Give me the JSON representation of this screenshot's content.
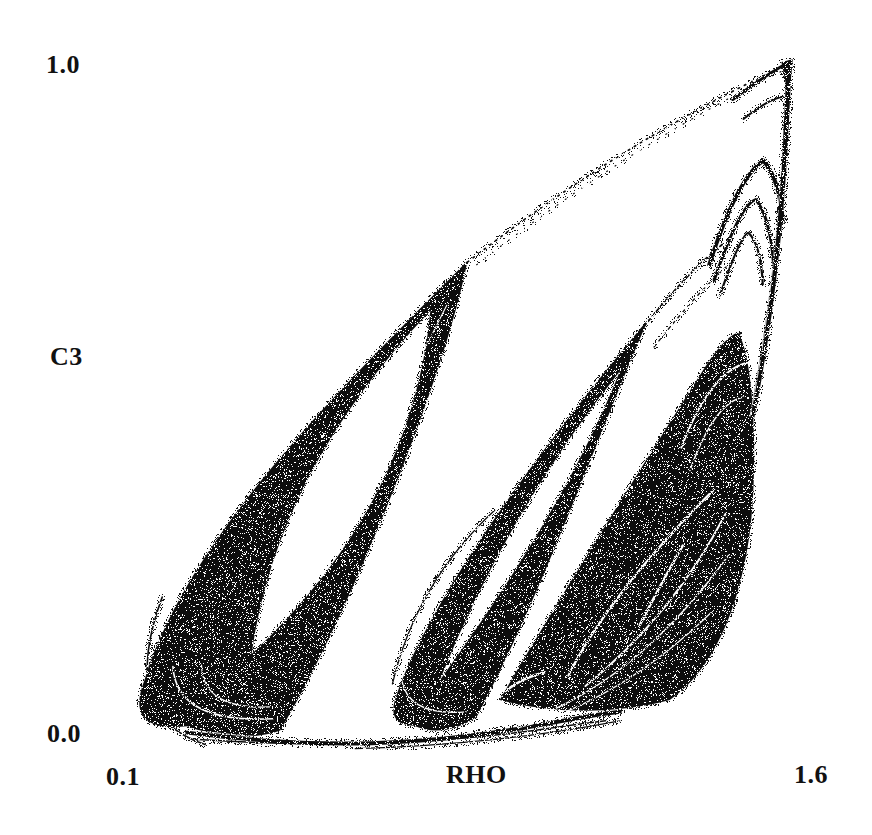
{
  "figure": {
    "background": "#ffffff",
    "ink": "#0d0d0d",
    "y_axis": {
      "label": "C3",
      "tick_top": "1.0",
      "tick_bottom": "0.0"
    },
    "x_axis": {
      "label": "RHO",
      "tick_left": "0.1",
      "tick_right": "1.6"
    }
  },
  "chart_data": {
    "type": "scatter",
    "title": "",
    "xlabel": "RHO",
    "ylabel": "C3",
    "xlim": [
      0.1,
      1.6
    ],
    "ylim": [
      0.0,
      1.0
    ],
    "xticks": [
      "0.1",
      "1.6"
    ],
    "yticks": [
      "0.0",
      "1.0"
    ],
    "grid": false,
    "legend": null,
    "key_points_data_units": {
      "cusp": [
        1.53,
        0.99
      ],
      "left_lobe_tip": [
        0.86,
        0.7
      ],
      "left_lobe_turn": [
        0.25,
        0.05
      ],
      "middle_lobe_tip": [
        1.24,
        0.62
      ],
      "middle_lobe_turn": [
        0.73,
        0.07
      ],
      "right_spiral_core": [
        1.27,
        0.23
      ],
      "bottom_tail_c3": 0.03
    },
    "geometry": {
      "dark_fills": [
        {
          "name": "left-lobe",
          "path": [
            [
              "M",
              0.507,
              0.296
            ],
            [
              "C",
              0.36,
              0.45,
              0.12,
              0.68,
              0.055,
              0.9
            ],
            [
              "C",
              0.035,
              0.952,
              0.058,
              0.972,
              0.115,
              0.966
            ],
            [
              "C",
              0.16,
              0.984,
              0.21,
              0.985,
              0.245,
              0.972
            ],
            [
              "C",
              0.33,
              0.83,
              0.475,
              0.47,
              0.507,
              0.296
            ],
            [
              "Z"
            ]
          ]
        },
        {
          "name": "middle-lobe",
          "path": [
            [
              "M",
              0.76,
              0.38
            ],
            [
              "C",
              0.63,
              0.54,
              0.465,
              0.76,
              0.408,
              0.92
            ],
            [
              "C",
              0.396,
              0.952,
              0.408,
              0.964,
              0.432,
              0.965
            ],
            [
              "C",
              0.46,
              0.978,
              0.492,
              0.972,
              0.52,
              0.952
            ],
            [
              "C",
              0.61,
              0.78,
              0.69,
              0.545,
              0.76,
              0.38
            ],
            [
              "Z"
            ]
          ]
        },
        {
          "name": "right-mass",
          "path": [
            [
              "M",
              0.552,
              0.928
            ],
            [
              "C",
              0.63,
              0.79,
              0.77,
              0.56,
              0.845,
              0.44
            ],
            [
              "C",
              0.862,
              0.415,
              0.878,
              0.4,
              0.885,
              0.4
            ],
            [
              "C",
              0.908,
              0.43,
              0.915,
              0.6,
              0.9,
              0.7
            ],
            [
              "C",
              0.885,
              0.8,
              0.85,
              0.885,
              0.79,
              0.928
            ],
            [
              "C",
              0.7,
              0.952,
              0.615,
              0.945,
              0.552,
              0.928
            ],
            [
              "Z"
            ]
          ]
        },
        {
          "name": "cusp-tip",
          "path": [
            [
              "M",
              0.946,
              0.01
            ],
            [
              "L",
              0.962,
              0.006
            ],
            [
              "L",
              0.956,
              0.06
            ],
            [
              "Z"
            ]
          ]
        }
      ],
      "white_fills": [
        {
          "name": "left-lobe-hole",
          "path": [
            [
              "M",
              0.455,
              0.368
            ],
            [
              "Q",
              0.24,
              0.6,
              0.205,
              0.862
            ],
            [
              "Q",
              0.43,
              0.645,
              0.455,
              0.368
            ],
            [
              "Z"
            ]
          ]
        },
        {
          "name": "middle-lobe-hole",
          "path": [
            [
              "M",
              0.72,
              0.455
            ],
            [
              "Q",
              0.562,
              0.658,
              0.468,
              0.9
            ],
            [
              "Q",
              0.646,
              0.648,
              0.72,
              0.455
            ],
            [
              "Z"
            ]
          ]
        }
      ],
      "dark_strokes": [
        {
          "name": "bottom-tail",
          "w": 4,
          "path": [
            [
              "M",
              0.115,
              0.975
            ],
            [
              "C",
              0.3,
              1.0,
              0.45,
              0.995,
              0.62,
              0.962
            ],
            [
              "Q",
              0.68,
              0.95,
              0.72,
              0.945
            ]
          ]
        },
        {
          "name": "bottom-tail-2",
          "w": 1.6,
          "path": [
            [
              "M",
              0.13,
              0.985
            ],
            [
              "Q",
              0.38,
              1.002,
              0.6,
              0.972
            ],
            [
              "Q",
              0.66,
              0.963,
              0.7,
              0.958
            ]
          ]
        },
        {
          "name": "bottom-tail-3",
          "w": 1.2,
          "path": [
            [
              "M",
              0.35,
              0.998
            ],
            [
              "Q",
              0.55,
              0.992,
              0.72,
              0.958
            ]
          ]
        },
        {
          "name": "left-lobe-echo",
          "w": 1.6,
          "path": [
            [
              "M",
              0.08,
              0.78
            ],
            [
              "Q",
              0.018,
              0.952,
              0.14,
              0.992
            ]
          ]
        },
        {
          "name": "middle-lobe-echo",
          "w": 1.3,
          "path": [
            [
              "M",
              0.402,
              0.905
            ],
            [
              "Q",
              0.435,
              0.76,
              0.545,
              0.655
            ]
          ]
        },
        {
          "name": "right-spine",
          "w": 5,
          "path": [
            [
              "M",
              0.905,
              0.52
            ],
            [
              "C",
              0.928,
              0.4,
              0.945,
              0.26,
              0.952,
              0.118
            ],
            [
              "Q",
              0.955,
              0.05,
              0.957,
              0.012
            ]
          ]
        },
        {
          "name": "fold-1a",
          "w": 4,
          "path": [
            [
              "M",
              0.845,
              0.302
            ],
            [
              "Q",
              0.885,
              0.175,
              0.921,
              0.152
            ],
            [
              "Q",
              0.944,
              0.18,
              0.948,
              0.24
            ]
          ]
        },
        {
          "name": "fold-1b",
          "w": 3,
          "path": [
            [
              "M",
              0.852,
              0.324
            ],
            [
              "Q",
              0.888,
              0.215,
              0.91,
              0.208
            ],
            [
              "Q",
              0.93,
              0.232,
              0.935,
              0.3
            ]
          ]
        },
        {
          "name": "fold-1c",
          "w": 2.2,
          "path": [
            [
              "M",
              0.86,
              0.346
            ],
            [
              "Q",
              0.89,
              0.256,
              0.9,
              0.256
            ],
            [
              "Q",
              0.917,
              0.272,
              0.92,
              0.33
            ]
          ]
        },
        {
          "name": "cusp-hook-a",
          "w": 3,
          "path": [
            [
              "M",
              0.878,
              0.064
            ],
            [
              "Q",
              0.925,
              0.028,
              0.957,
              0.01
            ]
          ]
        },
        {
          "name": "cusp-hook-b",
          "w": 2,
          "path": [
            [
              "M",
              0.893,
              0.092
            ],
            [
              "Q",
              0.93,
              0.062,
              0.948,
              0.06
            ]
          ]
        },
        {
          "name": "fold-2a",
          "w": 2.5,
          "path": [
            [
              "M",
              0.806,
              0.54
            ],
            [
              "Q",
              0.846,
              0.435,
              0.887,
              0.402
            ]
          ]
        }
      ],
      "white_strokes": [
        {
          "name": "left-u-sliver-1",
          "w": 1.6,
          "path": [
            [
              "M",
              0.095,
              0.88
            ],
            [
              "Q",
              0.1,
              0.962,
              0.235,
              0.955
            ]
          ]
        },
        {
          "name": "left-u-sliver-2",
          "w": 1.2,
          "path": [
            [
              "M",
              0.135,
              0.878
            ],
            [
              "Q",
              0.137,
              0.942,
              0.23,
              0.938
            ]
          ]
        },
        {
          "name": "left-right-hairline",
          "w": 1.1,
          "path": [
            [
              "M",
              0.478,
              0.36
            ],
            [
              "Q",
              0.408,
              0.5,
              0.35,
              0.64
            ]
          ]
        },
        {
          "name": "middle-u-sliver",
          "w": 1.3,
          "path": [
            [
              "M",
              0.415,
              0.9
            ],
            [
              "Q",
              0.425,
              0.952,
              0.505,
              0.945
            ]
          ]
        },
        {
          "name": "tail-hairline",
          "w": 1.1,
          "path": [
            [
              "M",
              0.125,
              0.972
            ],
            [
              "C",
              0.3,
              0.994,
              0.44,
              0.99,
              0.6,
              0.955
            ]
          ]
        },
        {
          "name": "eye-upper-arc",
          "w": 2.2,
          "path": [
            [
              "M",
              0.648,
              0.893
            ],
            [
              "Q",
              0.705,
              0.775,
              0.852,
              0.625
            ]
          ]
        },
        {
          "name": "eye-lower-arc",
          "w": 2.0,
          "path": [
            [
              "M",
              0.672,
              0.908
            ],
            [
              "Q",
              0.795,
              0.805,
              0.868,
              0.66
            ]
          ]
        },
        {
          "name": "eye-core-sliver",
          "w": 2.5,
          "path": [
            [
              "M",
              0.748,
              0.82
            ],
            [
              "Q",
              0.778,
              0.76,
              0.808,
              0.706
            ]
          ]
        },
        {
          "name": "ring-arc-1",
          "w": 1.6,
          "path": [
            [
              "M",
              0.62,
              0.945
            ],
            [
              "Q",
              0.755,
              0.885,
              0.872,
              0.72
            ]
          ]
        },
        {
          "name": "ring-arc-2",
          "w": 1.2,
          "path": [
            [
              "M",
              0.578,
              0.968
            ],
            [
              "Q",
              0.72,
              0.93,
              0.85,
              0.8
            ]
          ]
        },
        {
          "name": "inner-u-sliver",
          "w": 2.5,
          "path": [
            [
              "M",
              0.56,
              0.915
            ],
            [
              "Q",
              0.585,
              0.895,
              0.615,
              0.888
            ]
          ]
        },
        {
          "name": "fold-2-gap-1",
          "w": 2,
          "path": [
            [
              "M",
              0.806,
              0.565
            ],
            [
              "Q",
              0.846,
              0.455,
              0.9,
              0.442
            ]
          ]
        },
        {
          "name": "fold-2-gap-2",
          "w": 1.5,
          "path": [
            [
              "M",
              0.818,
              0.598
            ],
            [
              "Q",
              0.852,
              0.5,
              0.893,
              0.492
            ]
          ]
        },
        {
          "name": "spine-hairline",
          "w": 0.9,
          "path": [
            [
              "M",
              0.902,
              0.52
            ],
            [
              "C",
              0.926,
              0.4,
              0.941,
              0.262,
              0.948,
              0.12
            ]
          ]
        }
      ],
      "dashed_strokes": [
        {
          "name": "upper-boundary-dots",
          "w": 1.7,
          "dash": [
            1.5,
            5.5
          ],
          "path": [
            [
              "M",
              0.507,
              0.298
            ],
            [
              "Q",
              0.73,
              0.12,
              0.956,
              0.013
            ]
          ]
        },
        {
          "name": "upper-boundary-dots-2",
          "w": 1.2,
          "dash": [
            1,
            9
          ],
          "off": 3,
          "path": [
            [
              "M",
              0.512,
              0.308
            ],
            [
              "Q",
              0.733,
              0.13,
              0.953,
              0.02
            ]
          ]
        },
        {
          "name": "middle-continuation-1",
          "w": 1.8,
          "dash": [
            3,
            3.5
          ],
          "path": [
            [
              "M",
              0.748,
              0.398
            ],
            [
              "Q",
              0.812,
              0.315,
              0.864,
              0.272
            ]
          ]
        },
        {
          "name": "middle-continuation-2",
          "w": 1.4,
          "dash": [
            2.5,
            5
          ],
          "path": [
            [
              "M",
              0.768,
              0.42
            ],
            [
              "Q",
              0.825,
              0.345,
              0.874,
              0.3
            ]
          ]
        }
      ],
      "noise": {
        "white_speck_prob": 0.13,
        "edge_speck_prob": 0.22,
        "seed": 91234
      }
    }
  }
}
